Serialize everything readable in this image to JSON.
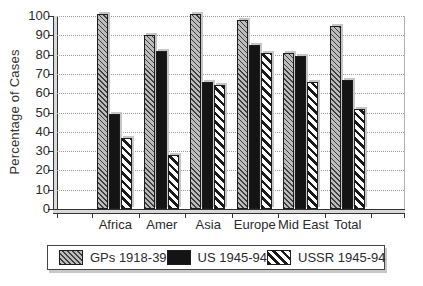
{
  "chart_data": {
    "type": "bar",
    "title": "",
    "ylabel": "Percentage of Cases",
    "xlabel": "",
    "categories": [
      "Africa",
      "Amer",
      "Asia",
      "Europe",
      "Mid East",
      "Total"
    ],
    "series": [
      {
        "name": "GPs 1918-39",
        "pattern": "gray-diagonal-hatch",
        "values": [
          100,
          89,
          100,
          97,
          80,
          94
        ]
      },
      {
        "name": "US 1945-94",
        "pattern": "solid-black",
        "values": [
          48,
          81,
          65,
          84,
          78,
          66
        ]
      },
      {
        "name": "USSR 1945-94",
        "pattern": "white-diagonal-hatch",
        "values": [
          36,
          27,
          63,
          80,
          65,
          51
        ]
      }
    ],
    "ylim": [
      0,
      100
    ],
    "yticks": [
      0,
      10,
      20,
      30,
      40,
      50,
      60,
      70,
      80,
      90,
      100
    ],
    "grid": "horizontal-dotted",
    "legend_position": "bottom"
  },
  "colors": {
    "background": "#ffffff",
    "bar_gray": "#bcbcbc",
    "bar_black": "#141414",
    "hatch_line": "#1a1a1a",
    "axis": "#333333",
    "gridline": "#9b9b9b",
    "text": "#2b2b2b",
    "bar_shadow": "#c6c6c6"
  }
}
